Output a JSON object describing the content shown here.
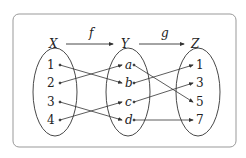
{
  "diagram": {
    "sets": [
      {
        "name": "X",
        "elements": [
          "1",
          "2",
          "3",
          "4"
        ]
      },
      {
        "name": "Y",
        "elements": [
          "a",
          "b",
          "c",
          "d"
        ]
      },
      {
        "name": "Z",
        "elements": [
          "1",
          "3",
          "5",
          "7"
        ]
      }
    ],
    "functions": [
      {
        "name": "f",
        "from": "X",
        "to": "Y"
      },
      {
        "name": "g",
        "from": "Y",
        "to": "Z"
      }
    ],
    "mappings": {
      "f": [
        [
          "1",
          "b"
        ],
        [
          "2",
          "a"
        ],
        [
          "3",
          "d"
        ],
        [
          "4",
          "c"
        ]
      ],
      "g": [
        [
          "a",
          "5"
        ],
        [
          "b",
          "1"
        ],
        [
          "c",
          "3"
        ],
        [
          "d",
          "7"
        ]
      ]
    },
    "colors": {
      "line": "#333333",
      "frame": "#999999",
      "background": "#ffffff"
    }
  }
}
